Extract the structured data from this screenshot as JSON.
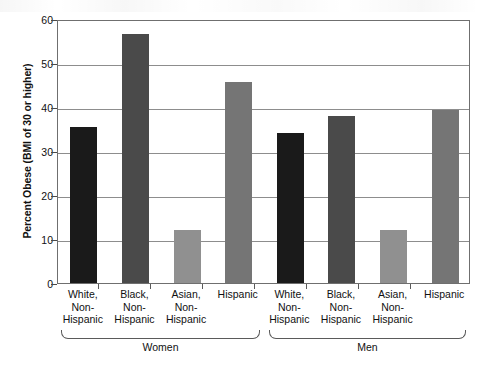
{
  "chart_data": {
    "type": "bar",
    "title": "",
    "xlabel": "",
    "ylabel": "Percent Obese (BMI of 30 or higher)",
    "ylim": [
      0,
      60
    ],
    "yticks": [
      0,
      10,
      20,
      30,
      40,
      50,
      60
    ],
    "grid": true,
    "legend": "none",
    "groups": [
      {
        "name": "Women",
        "label": "Women"
      },
      {
        "name": "Men",
        "label": "Men"
      }
    ],
    "categories": [
      "White, Non-Hispanic",
      "Black, Non-Hispanic",
      "Asian, Non-Hispanic",
      "Hispanic",
      "White, Non-Hispanic",
      "Black, Non-Hispanic",
      "Asian, Non-Hispanic",
      "Hispanic"
    ],
    "bars": [
      {
        "group": "Women",
        "race": "White, Non-Hispanic",
        "line1": "White,",
        "line2": "Non-",
        "line3": "Hispanic",
        "value": 35.5,
        "color": "#1a1a1a"
      },
      {
        "group": "Women",
        "race": "Black, Non-Hispanic",
        "line1": "Black,",
        "line2": "Non-",
        "line3": "Hispanic",
        "value": 56.6,
        "color": "#4a4a4a"
      },
      {
        "group": "Women",
        "race": "Asian, Non-Hispanic",
        "line1": "Asian,",
        "line2": "Non-",
        "line3": "Hispanic",
        "value": 12.0,
        "color": "#909090"
      },
      {
        "group": "Women",
        "race": "Hispanic",
        "line1": "Hispanic",
        "line2": "",
        "line3": "",
        "value": 45.7,
        "color": "#757575"
      },
      {
        "group": "Men",
        "race": "White, Non-Hispanic",
        "line1": "White,",
        "line2": "Non-",
        "line3": "Hispanic",
        "value": 34.1,
        "color": "#1a1a1a"
      },
      {
        "group": "Men",
        "race": "Black, Non-Hispanic",
        "line1": "Black,",
        "line2": "Non-",
        "line3": "Hispanic",
        "value": 38.0,
        "color": "#4a4a4a"
      },
      {
        "group": "Men",
        "race": "Asian, Non-Hispanic",
        "line1": "Asian,",
        "line2": "Non-",
        "line3": "Hispanic",
        "value": 12.0,
        "color": "#909090"
      },
      {
        "group": "Men",
        "race": "Hispanic",
        "line1": "Hispanic",
        "line2": "",
        "line3": "",
        "value": 39.3,
        "color": "#757575"
      }
    ]
  },
  "axis": {
    "tick_0": "0",
    "tick_10": "10",
    "tick_20": "20",
    "tick_30": "30",
    "tick_40": "40",
    "tick_50": "50",
    "tick_60": "60"
  }
}
